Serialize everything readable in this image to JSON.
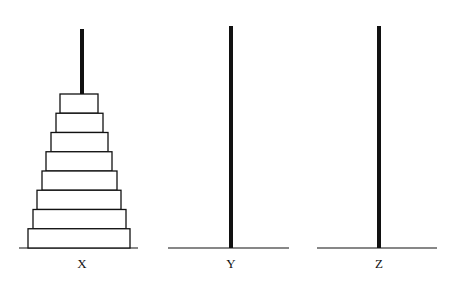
{
  "diagram": {
    "colors": {
      "stroke": "#111111",
      "disk_fill": "#ffffff",
      "background": "#ffffff"
    },
    "pegs": [
      {
        "label": "X",
        "x": 82,
        "top": 29,
        "base_left": 19,
        "base_right": 138,
        "disks": 8
      },
      {
        "label": "Y",
        "x": 231,
        "top": 26,
        "base_left": 168,
        "base_right": 289,
        "disks": 0
      },
      {
        "label": "Z",
        "x": 379,
        "top": 26,
        "base_left": 317,
        "base_right": 437,
        "disks": 0
      }
    ],
    "baseline_y": 248,
    "label_y": 268,
    "disks": [
      {
        "peg": "X",
        "left": 60,
        "right": 98
      },
      {
        "peg": "X",
        "left": 56,
        "right": 103
      },
      {
        "peg": "X",
        "left": 51,
        "right": 108
      },
      {
        "peg": "X",
        "left": 46,
        "right": 112
      },
      {
        "peg": "X",
        "left": 42,
        "right": 117
      },
      {
        "peg": "X",
        "left": 37,
        "right": 121
      },
      {
        "peg": "X",
        "left": 33,
        "right": 126
      },
      {
        "peg": "X",
        "left": 28,
        "right": 130
      }
    ],
    "disk_top": 94,
    "disk_height": 19.25
  }
}
